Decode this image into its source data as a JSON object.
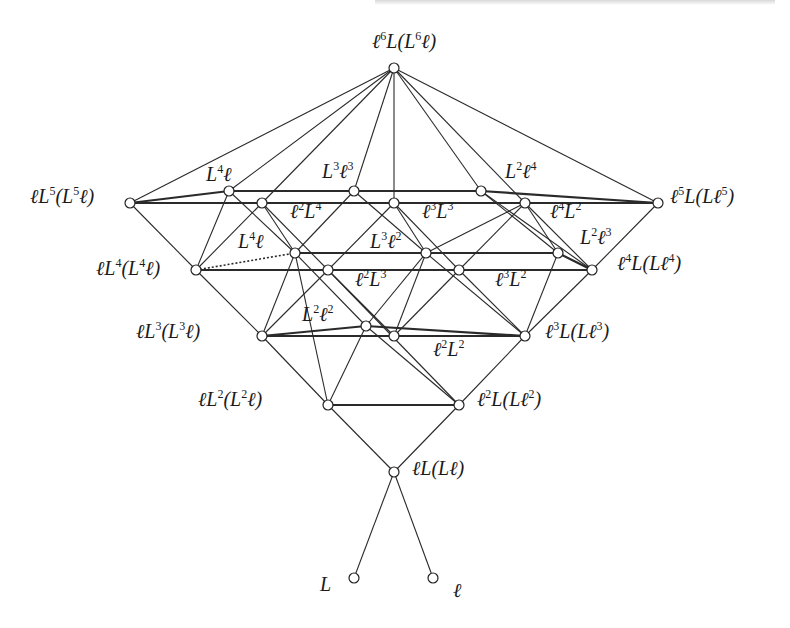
{
  "figure": {
    "type": "lattice-diagram",
    "header_fragment": "",
    "nodes": [
      {
        "id": "top",
        "label": "ℓ⁶L(L⁶ℓ)",
        "base": "ℓ",
        "parts": [
          [
            "ℓ",
            "6"
          ],
          [
            "L",
            ""
          ],
          [
            "(L",
            "6"
          ],
          [
            "ℓ)",
            ""
          ]
        ],
        "x": 394,
        "y": 68,
        "lx": 372,
        "ly": 30
      },
      {
        "id": "lL5",
        "label": "ℓL⁵(L⁵ℓ)",
        "parts": [
          [
            "ℓL",
            "5"
          ],
          [
            "(L",
            "5"
          ],
          [
            "ℓ)",
            ""
          ]
        ],
        "x": 130,
        "y": 203,
        "lx": 30,
        "ly": 185
      },
      {
        "id": "L4l_top",
        "label": "L⁴ℓ",
        "parts": [
          [
            "L",
            "4"
          ],
          [
            "ℓ",
            ""
          ]
        ],
        "x": 229,
        "y": 191,
        "lx": 206,
        "ly": 163
      },
      {
        "id": "l2L4",
        "label": "ℓ²L⁴",
        "parts": [
          [
            "ℓ",
            "2"
          ],
          [
            "L",
            "4"
          ]
        ],
        "x": 262,
        "y": 203,
        "lx": 290,
        "ly": 200
      },
      {
        "id": "L3l3",
        "label": "L³ℓ³",
        "parts": [
          [
            "L",
            "3"
          ],
          [
            "ℓ",
            "3"
          ]
        ],
        "x": 354,
        "y": 191,
        "lx": 322,
        "ly": 160
      },
      {
        "id": "l3L3",
        "label": "ℓ³L³",
        "parts": [
          [
            "ℓ",
            "3"
          ],
          [
            "L",
            "3"
          ]
        ],
        "x": 394,
        "y": 203,
        "lx": 422,
        "ly": 200
      },
      {
        "id": "L2l4",
        "label": "L²ℓ⁴",
        "parts": [
          [
            "L",
            "2"
          ],
          [
            "ℓ",
            "4"
          ]
        ],
        "x": 481,
        "y": 191,
        "lx": 505,
        "ly": 160
      },
      {
        "id": "l4L2",
        "label": "ℓ⁴L²",
        "parts": [
          [
            "ℓ",
            "4"
          ],
          [
            "L",
            "2"
          ]
        ],
        "x": 525,
        "y": 203,
        "lx": 550,
        "ly": 200
      },
      {
        "id": "l5L",
        "label": "ℓ⁵L(Lℓ⁵)",
        "parts": [
          [
            "ℓ",
            "5"
          ],
          [
            "L",
            ""
          ],
          [
            "(Lℓ",
            "5"
          ],
          [
            ")",
            ""
          ]
        ],
        "x": 658,
        "y": 203,
        "lx": 670,
        "ly": 185
      },
      {
        "id": "lL4",
        "label": "ℓL⁴(L⁴ℓ)",
        "parts": [
          [
            "ℓL",
            "4"
          ],
          [
            "(L",
            "4"
          ],
          [
            "ℓ)",
            ""
          ]
        ],
        "x": 196,
        "y": 270,
        "lx": 96,
        "ly": 257
      },
      {
        "id": "L4l_mid",
        "label": "L⁴ℓ",
        "parts": [
          [
            "L",
            "4"
          ],
          [
            "ℓ",
            ""
          ]
        ],
        "x": 295,
        "y": 253,
        "lx": 238,
        "ly": 230
      },
      {
        "id": "l2L3",
        "label": "ℓ²L³",
        "parts": [
          [
            "ℓ",
            "2"
          ],
          [
            "L",
            "3"
          ]
        ],
        "x": 328,
        "y": 270,
        "lx": 355,
        "ly": 268
      },
      {
        "id": "L3l2",
        "label": "L³ℓ²",
        "parts": [
          [
            "L",
            "3"
          ],
          [
            "ℓ",
            "2"
          ]
        ],
        "x": 426,
        "y": 253,
        "lx": 370,
        "ly": 230
      },
      {
        "id": "l3L2",
        "label": "ℓ³L²",
        "parts": [
          [
            "ℓ",
            "3"
          ],
          [
            "L",
            "2"
          ]
        ],
        "x": 459,
        "y": 270,
        "lx": 495,
        "ly": 268
      },
      {
        "id": "L2l3",
        "label": "L²ℓ³",
        "parts": [
          [
            "L",
            "2"
          ],
          [
            "ℓ",
            "3"
          ]
        ],
        "x": 558,
        "y": 253,
        "lx": 580,
        "ly": 226
      },
      {
        "id": "l4L",
        "label": "ℓ⁴L(Lℓ⁴)",
        "parts": [
          [
            "ℓ",
            "4"
          ],
          [
            "L",
            ""
          ],
          [
            "(Lℓ",
            "4"
          ],
          [
            ")",
            ""
          ]
        ],
        "x": 592,
        "y": 270,
        "lx": 617,
        "ly": 252
      },
      {
        "id": "lL3",
        "label": "ℓL³(L³ℓ)",
        "parts": [
          [
            "ℓL",
            "3"
          ],
          [
            "(L",
            "3"
          ],
          [
            "ℓ)",
            ""
          ]
        ],
        "x": 262,
        "y": 336,
        "lx": 136,
        "ly": 320
      },
      {
        "id": "L2l2",
        "label": "L²ℓ²",
        "parts": [
          [
            "L",
            "2"
          ],
          [
            "ℓ",
            "2"
          ]
        ],
        "x": 366,
        "y": 326,
        "lx": 302,
        "ly": 303
      },
      {
        "id": "l2L2",
        "label": "ℓ²L²",
        "parts": [
          [
            "ℓ",
            "2"
          ],
          [
            "L",
            "2"
          ]
        ],
        "x": 394,
        "y": 336,
        "lx": 433,
        "ly": 338
      },
      {
        "id": "l3L",
        "label": "ℓ³L(Lℓ³)",
        "parts": [
          [
            "ℓ",
            "3"
          ],
          [
            "L",
            ""
          ],
          [
            "(Lℓ",
            "3"
          ],
          [
            ")",
            ""
          ]
        ],
        "x": 525,
        "y": 336,
        "lx": 545,
        "ly": 320
      },
      {
        "id": "lL2",
        "label": "ℓL²(L²ℓ)",
        "parts": [
          [
            "ℓL",
            "2"
          ],
          [
            "(L",
            "2"
          ],
          [
            "ℓ)",
            ""
          ]
        ],
        "x": 328,
        "y": 405,
        "lx": 198,
        "ly": 388
      },
      {
        "id": "l2L",
        "label": "ℓ²L(Lℓ²)",
        "parts": [
          [
            "ℓ",
            "2"
          ],
          [
            "L",
            ""
          ],
          [
            "(Lℓ",
            "2"
          ],
          [
            ")",
            ""
          ]
        ],
        "x": 459,
        "y": 405,
        "lx": 477,
        "ly": 388
      },
      {
        "id": "lL",
        "label": "ℓL(Lℓ)",
        "parts": [
          [
            "ℓL",
            ""
          ],
          [
            "(Lℓ)",
            ""
          ]
        ],
        "x": 394,
        "y": 472,
        "lx": 412,
        "ly": 458
      },
      {
        "id": "L",
        "label": "L",
        "parts": [
          [
            "L",
            ""
          ]
        ],
        "x": 354,
        "y": 578,
        "lx": 320,
        "ly": 574
      },
      {
        "id": "l",
        "label": "ℓ",
        "parts": [
          [
            "ℓ",
            ""
          ]
        ],
        "x": 433,
        "y": 578,
        "lx": 453,
        "ly": 580
      }
    ],
    "edges": [
      [
        "L",
        "lL"
      ],
      [
        "l",
        "lL"
      ],
      [
        "lL",
        "lL2"
      ],
      [
        "lL",
        "l2L"
      ],
      [
        "lL2",
        "l2L",
        "thick"
      ],
      [
        "lL2",
        "lL3"
      ],
      [
        "lL2",
        "L2l2"
      ],
      [
        "lL2",
        "L4l_mid"
      ],
      [
        "l2L",
        "l3L"
      ],
      [
        "l2L",
        "L2l2"
      ],
      [
        "l2L",
        "l2L3"
      ],
      [
        "lL3",
        "L2l2",
        "thick"
      ],
      [
        "lL3",
        "l2L2",
        "thick"
      ],
      [
        "L2l2",
        "l3L",
        "thick"
      ],
      [
        "l2L2",
        "l3L",
        "thick"
      ],
      [
        "lL3",
        "lL4"
      ],
      [
        "lL3",
        "L4l_mid"
      ],
      [
        "lL3",
        "l2L3"
      ],
      [
        "L2l2",
        "L3l2"
      ],
      [
        "L2l2",
        "L4l_mid"
      ],
      [
        "l2L2",
        "l2L3"
      ],
      [
        "l2L2",
        "l3L2"
      ],
      [
        "l2L2",
        "L3l2"
      ],
      [
        "l3L",
        "l4L"
      ],
      [
        "l3L",
        "l3L2"
      ],
      [
        "l3L",
        "L2l3"
      ],
      [
        "l3L",
        "L3l2"
      ],
      [
        "lL4",
        "L4l_mid",
        "dotted"
      ],
      [
        "lL4",
        "l2L3",
        "thick"
      ],
      [
        "l2L3",
        "l3L2",
        "thick"
      ],
      [
        "l3L2",
        "l4L",
        "thick"
      ],
      [
        "L4l_mid",
        "L3l2",
        "thick"
      ],
      [
        "L3l2",
        "L2l3",
        "thick"
      ],
      [
        "L2l3",
        "l4L",
        "thick"
      ],
      [
        "lL4",
        "lL5"
      ],
      [
        "lL4",
        "L4l_top"
      ],
      [
        "lL4",
        "l2L4"
      ],
      [
        "L4l_mid",
        "L4l_top"
      ],
      [
        "L4l_mid",
        "L3l3"
      ],
      [
        "L4l_mid",
        "l2L4"
      ],
      [
        "l2L3",
        "l2L4"
      ],
      [
        "l2L3",
        "l3L3"
      ],
      [
        "L3l2",
        "L3l3"
      ],
      [
        "L3l2",
        "l3L3"
      ],
      [
        "L3l2",
        "l4L2"
      ],
      [
        "l3L2",
        "l3L3"
      ],
      [
        "l3L2",
        "l4L2"
      ],
      [
        "L2l3",
        "L2l4"
      ],
      [
        "L2l3",
        "l4L2"
      ],
      [
        "l4L",
        "l5L"
      ],
      [
        "l4L",
        "l4L2"
      ],
      [
        "l4L",
        "L2l4"
      ],
      [
        "lL5",
        "L4l_top",
        "thick"
      ],
      [
        "L4l_top",
        "L3l3",
        "thick"
      ],
      [
        "L3l3",
        "L2l4",
        "thick"
      ],
      [
        "L2l4",
        "l5L",
        "thick"
      ],
      [
        "lL5",
        "l2L4",
        "thick"
      ],
      [
        "l2L4",
        "l3L3",
        "thick"
      ],
      [
        "l3L3",
        "l4L2",
        "thick"
      ],
      [
        "l4L2",
        "l5L",
        "thick"
      ],
      [
        "top",
        "lL5"
      ],
      [
        "top",
        "L4l_top"
      ],
      [
        "top",
        "l2L4"
      ],
      [
        "top",
        "L3l3"
      ],
      [
        "top",
        "l3L3"
      ],
      [
        "top",
        "L2l4"
      ],
      [
        "top",
        "l4L2"
      ],
      [
        "top",
        "l5L"
      ]
    ]
  }
}
